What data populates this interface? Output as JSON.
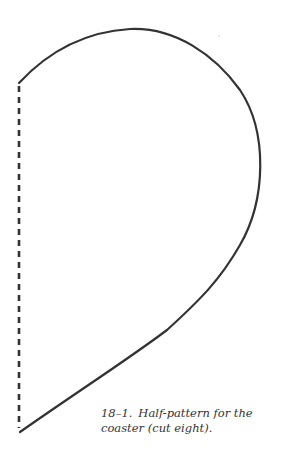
{
  "figure": {
    "number": "18–1.",
    "caption_line1": "Half-pattern for the",
    "caption_line2": "coaster (cut eight).",
    "stroke_color": "#333333",
    "outline_style": "solid curve",
    "fold_line_style": "dashed"
  }
}
